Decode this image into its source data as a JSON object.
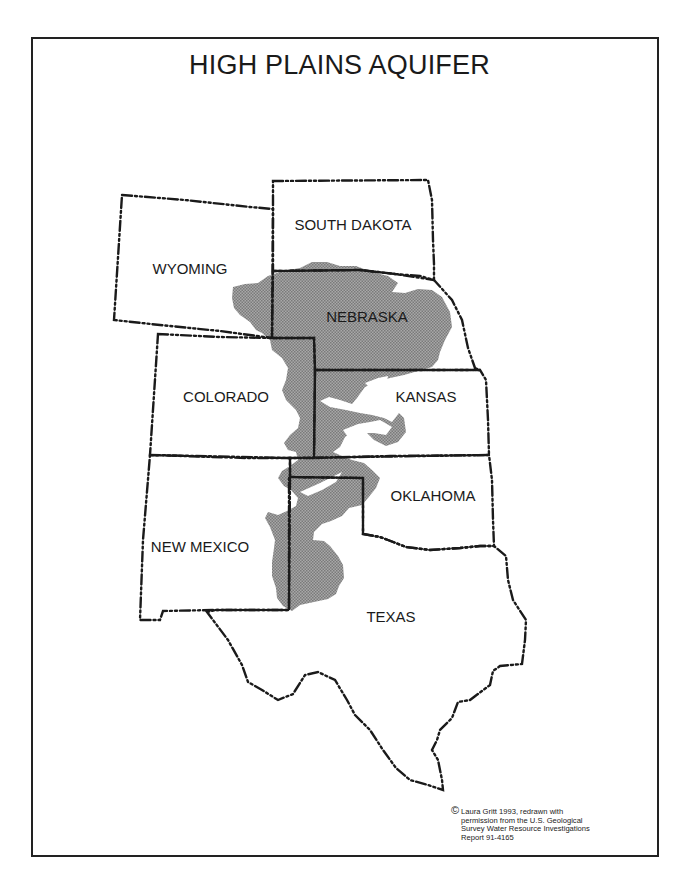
{
  "title": "HIGH PLAINS AQUIFER",
  "map": {
    "states": [
      {
        "name": "WYOMING",
        "x": 190,
        "y": 274
      },
      {
        "name": "SOUTH DAKOTA",
        "x": 353,
        "y": 230
      },
      {
        "name": "NEBRASKA",
        "x": 367,
        "y": 322
      },
      {
        "name": "COLORADO",
        "x": 226,
        "y": 402
      },
      {
        "name": "KANSAS",
        "x": 426,
        "y": 402
      },
      {
        "name": "OKLAHOMA",
        "x": 433,
        "y": 501
      },
      {
        "name": "NEW MEXICO",
        "x": 200,
        "y": 552
      },
      {
        "name": "TEXAS",
        "x": 391,
        "y": 622
      }
    ],
    "aquifer_fill_color": "#9a9a9a",
    "border_color": "#1a1a1a",
    "border_style": "dash-dot-dot"
  },
  "credit": {
    "symbol": "©",
    "lines": [
      "Laura Gritt 1993, redrawn with",
      "permission from the U.S. Geological",
      "Survey Water Resource Investigations",
      "Report 91-4165"
    ]
  }
}
